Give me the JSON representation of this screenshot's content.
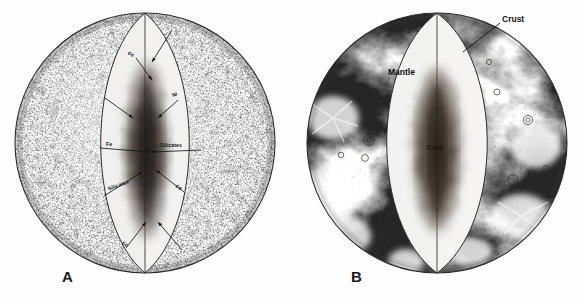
{
  "figure": {
    "style": "pen-and-ink stipple engraving",
    "background_color": "#ffffff",
    "ink_color": "#1a1a1a",
    "panel_count": 2
  },
  "panels": [
    {
      "id": "A",
      "letter": "A",
      "letter_x": 62,
      "letter_y": 268,
      "center_x": 145,
      "center_y": 143,
      "radius": 130,
      "surface_style": "uniform fine stipple / granular speckle",
      "cut_style": "vesica (lens) wedge opened at the poles revealing graded core",
      "description": "Compositional model: arrows point from the opened interior wedge to composition labels",
      "annotations": [
        {
          "name": "fe-upper-left",
          "text": "Fe",
          "x": 128,
          "y": 50,
          "rot": "rot-b",
          "arrow": {
            "x1": 136,
            "y1": 58,
            "x2": 152,
            "y2": 80
          }
        },
        {
          "name": "ni-upper-right",
          "text": "Ni",
          "x": 172,
          "y": 92,
          "rot": "rot-c",
          "arrow": {
            "x1": 178,
            "y1": 100,
            "x2": 158,
            "y2": 118
          }
        },
        {
          "name": "arrow-upper-right-outer",
          "text": "",
          "x": 0,
          "y": 0,
          "rot": "",
          "arrow": {
            "x1": 172,
            "y1": 30,
            "x2": 152,
            "y2": 62
          }
        },
        {
          "name": "arrow-mid-left-outer",
          "text": "",
          "x": 0,
          "y": 0,
          "rot": "",
          "arrow": {
            "x1": 105,
            "y1": 98,
            "x2": 133,
            "y2": 118
          }
        },
        {
          "name": "fe-mid-left",
          "text": "Fe",
          "x": 106,
          "y": 141,
          "rot": "",
          "arrow": {
            "x1": 100,
            "y1": 148,
            "x2": 150,
            "y2": 152
          }
        },
        {
          "name": "silicates-mid-right",
          "text": "Silicates",
          "x": 160,
          "y": 142,
          "rot": "",
          "arrow": {
            "x1": 201,
            "y1": 150,
            "x2": 152,
            "y2": 152
          }
        },
        {
          "name": "silicates-lower-left",
          "text": "Silicates",
          "x": 108,
          "y": 186,
          "rot": "rot-a",
          "arrow": {
            "x1": 104,
            "y1": 196,
            "x2": 142,
            "y2": 172
          }
        },
        {
          "name": "fe-lower-right",
          "text": "Fe",
          "x": 176,
          "y": 183,
          "rot": "rot-d",
          "arrow": {
            "x1": 184,
            "y1": 192,
            "x2": 156,
            "y2": 170
          }
        },
        {
          "name": "fe-bottom-left",
          "text": "Fe",
          "x": 122,
          "y": 240,
          "rot": "rot-b",
          "arrow": {
            "x1": 126,
            "y1": 248,
            "x2": 146,
            "y2": 222
          }
        },
        {
          "name": "arrow-bottom-right-outer",
          "text": "",
          "x": 0,
          "y": 0,
          "rot": "",
          "arrow": {
            "x1": 182,
            "y1": 250,
            "x2": 158,
            "y2": 222
          }
        }
      ]
    },
    {
      "id": "B",
      "letter": "B",
      "letter_x": 351,
      "letter_y": 268,
      "center_x": 437,
      "center_y": 143,
      "radius": 130,
      "surface_style": "lunar surface: dark maria, bright highlands, craters and ray systems",
      "cut_style": "vesica (lens) wedge opened at the poles revealing graded core",
      "description": "Layer model: crust, mantle and core identified on the cut face",
      "annotations": [
        {
          "name": "crust-label",
          "text": "Crust",
          "x": 502,
          "y": 14,
          "rot": "",
          "arrow": {
            "x1": 500,
            "y1": 23,
            "x2": 463,
            "y2": 52
          }
        },
        {
          "name": "mantle-label",
          "text": "Mantle",
          "x": 388,
          "y": 67,
          "rot": "",
          "arrow": null
        },
        {
          "name": "core-label",
          "text": "Core",
          "x": 427,
          "y": 144,
          "rot": "",
          "arrow": null
        }
      ]
    }
  ],
  "layers_legend": {
    "crust": "Crust",
    "mantle": "Mantle",
    "core": "Core"
  },
  "composition_symbols": {
    "iron": "Fe",
    "nickel": "Ni",
    "silicates": "Silicates"
  }
}
